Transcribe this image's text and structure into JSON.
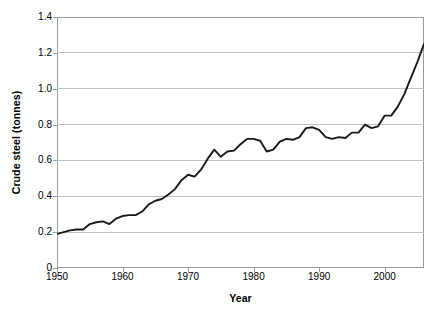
{
  "chart_data": {
    "type": "line",
    "title": "",
    "xlabel": "Year",
    "ylabel": "Crude steel (tonnes)",
    "xlim": [
      1950,
      2006
    ],
    "ylim": [
      0,
      1.4
    ],
    "grid": "horizontal",
    "legend": "none",
    "xticks": [
      1950,
      1960,
      1970,
      1980,
      1990,
      2000
    ],
    "xtick_labels": [
      "1950",
      "1960",
      "1970",
      "1980",
      "1990",
      "2000"
    ],
    "yticks": [
      0,
      0.2,
      0.4,
      0.6,
      0.8,
      1.0,
      1.2,
      1.4
    ],
    "ytick_labels": [
      "0",
      "0.2",
      "0.4",
      "0.6",
      "0.8",
      "1.0",
      "1.2",
      "1.4"
    ],
    "line_color": "#1a1a1a",
    "grid_color": "#bfbfbf",
    "axis_color": "#9a9a9a",
    "series": [
      {
        "name": "Crude steel",
        "x": [
          1950,
          1951,
          1952,
          1953,
          1954,
          1955,
          1956,
          1957,
          1958,
          1959,
          1960,
          1961,
          1962,
          1963,
          1964,
          1965,
          1966,
          1967,
          1968,
          1969,
          1970,
          1971,
          1972,
          1973,
          1974,
          1975,
          1976,
          1977,
          1978,
          1979,
          1980,
          1981,
          1982,
          1983,
          1984,
          1985,
          1986,
          1987,
          1988,
          1989,
          1990,
          1991,
          1992,
          1993,
          1994,
          1995,
          1996,
          1997,
          1998,
          1999,
          2000,
          2001,
          2002,
          2003,
          2004,
          2005,
          2006
        ],
        "values": [
          0.19,
          0.2,
          0.21,
          0.215,
          0.215,
          0.245,
          0.255,
          0.26,
          0.245,
          0.275,
          0.29,
          0.295,
          0.295,
          0.315,
          0.355,
          0.375,
          0.385,
          0.41,
          0.44,
          0.49,
          0.52,
          0.51,
          0.55,
          0.61,
          0.66,
          0.62,
          0.65,
          0.655,
          0.69,
          0.72,
          0.72,
          0.71,
          0.65,
          0.66,
          0.705,
          0.72,
          0.715,
          0.73,
          0.78,
          0.785,
          0.77,
          0.73,
          0.72,
          0.73,
          0.725,
          0.755,
          0.755,
          0.8,
          0.78,
          0.79,
          0.85,
          0.85,
          0.9,
          0.97,
          1.06,
          1.15,
          1.25
        ]
      }
    ]
  }
}
